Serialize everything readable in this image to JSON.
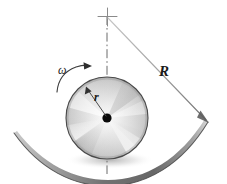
{
  "figure": {
    "name": "disk-rolling-in-concave-surface",
    "background_color": "#ffffff",
    "width": 227,
    "height": 184
  },
  "labels": {
    "radius_big": "R",
    "radius_small": "r",
    "angular_velocity": "ω"
  },
  "colors": {
    "line_dark": "#3a3a3a",
    "line_mid": "#8c8c8c",
    "line_light": "#b8b8b8",
    "disk_edge": "#4a4a4a",
    "hub": "#0a0a0a",
    "label_text": "#1a1a1a",
    "surface_dark": "#6e6e6e",
    "surface_light": "#cfcfcf"
  },
  "geometry": {
    "center_of_curvature": {
      "x": 107,
      "y": 16
    },
    "disk_center": {
      "x": 107,
      "y": 118
    },
    "disk_radius": 41,
    "track_radius_px": 106,
    "centerline_top": 16,
    "centerline_bottom": 174,
    "R_arrow_tip": {
      "x": 209,
      "y": 123
    },
    "r_arrow_tip": {
      "x": 86,
      "y": 87
    }
  },
  "icons": {
    "center_mark": "crosshair-icon",
    "hub": "hub-dot-icon",
    "spin_arrow": "curved-arrow-icon",
    "dimension_arrow": "arrowhead-icon"
  }
}
